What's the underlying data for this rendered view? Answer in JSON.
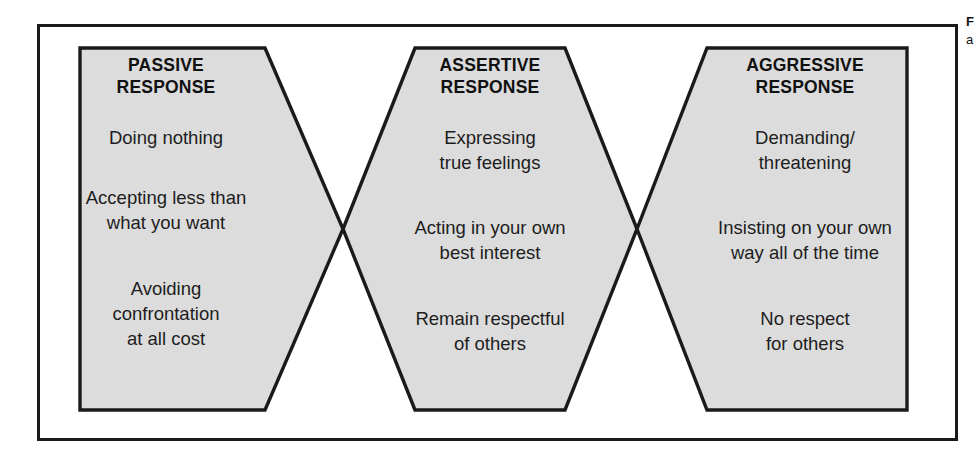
{
  "figure": {
    "background_color": "#ffffff",
    "frame_color": "#1a1a1a",
    "shape_fill_color": "#dcdcdc",
    "shape_stroke_color": "#1a1a1a",
    "text_color": "#1d1d1d"
  },
  "shapes": [
    {
      "id": "passive",
      "heading": [
        "PASSIVE",
        "RESPONSE"
      ],
      "items": [
        [
          "Doing nothing"
        ],
        [
          "Accepting less than",
          "what you want"
        ],
        [
          "Avoiding",
          "confrontation",
          "at all cost"
        ]
      ]
    },
    {
      "id": "assertive",
      "heading": [
        "ASSERTIVE",
        "RESPONSE"
      ],
      "items": [
        [
          "Expressing",
          "true feelings"
        ],
        [
          "Acting in your own",
          "best interest"
        ],
        [
          "Remain respectful",
          "of others"
        ]
      ]
    },
    {
      "id": "aggressive",
      "heading": [
        "AGGRESSIVE",
        "RESPONSE"
      ],
      "items": [
        [
          "Demanding/",
          "threatening"
        ],
        [
          "Insisting on your own",
          "way all of the time"
        ],
        [
          "No respect",
          "for others"
        ]
      ]
    }
  ],
  "margin_note": {
    "title": "F",
    "subtitle": "a"
  }
}
